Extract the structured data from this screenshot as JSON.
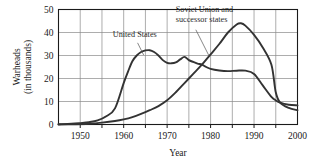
{
  "chart_data": {
    "type": "line",
    "title": "",
    "xlabel": "Year",
    "ylabel": "Warheads (in thousands)",
    "ylabel_line1": "Warheads",
    "ylabel_line2": "(in thousands)",
    "xlim": [
      1945,
      2000
    ],
    "ylim": [
      0,
      50
    ],
    "xticks": [
      1950,
      1960,
      1970,
      1980,
      1990,
      2000
    ],
    "xtick_labels": [
      "1950",
      "1960",
      "1970",
      "1980",
      "1990",
      "2000"
    ],
    "yticks": [
      0,
      10,
      20,
      30,
      40,
      50
    ],
    "ytick_labels": [
      "0",
      "10",
      "20",
      "30",
      "40",
      "50"
    ],
    "x_gridlines": [
      1950,
      1955,
      1960,
      1965,
      1970,
      1975,
      1980,
      1985,
      1990,
      1995
    ],
    "y_gridlines": [
      10,
      20,
      30,
      40
    ],
    "x_minor_ticks": [
      1950,
      1955,
      1960,
      1965,
      1970,
      1975,
      1980,
      1985,
      1990,
      1995
    ],
    "grid": true,
    "legend_position": "inline-annotations",
    "series": [
      {
        "name": "United States",
        "label": "United States",
        "color": "#333333",
        "x": [
          1945,
          1948,
          1950,
          1952,
          1954,
          1956,
          1958,
          1960,
          1961,
          1962,
          1963,
          1964,
          1965,
          1966,
          1967,
          1968,
          1969,
          1970,
          1971,
          1972,
          1973,
          1974,
          1975,
          1976,
          1977,
          1978,
          1979,
          1980,
          1982,
          1984,
          1986,
          1988,
          1990,
          1992,
          1994,
          1995,
          1996,
          1998,
          2000
        ],
        "values": [
          0.1,
          0.3,
          0.6,
          1.0,
          1.8,
          3.6,
          7.0,
          18.0,
          23.0,
          27.5,
          30.0,
          31.5,
          32.2,
          32.3,
          31.5,
          30.0,
          28.0,
          26.8,
          26.6,
          27.0,
          28.3,
          29.4,
          28.0,
          27.2,
          26.5,
          26.0,
          25.0,
          24.2,
          23.5,
          23.2,
          23.4,
          23.4,
          22.0,
          17.0,
          12.0,
          10.5,
          9.5,
          8.6,
          8.3
        ]
      },
      {
        "name": "Soviet Union and successor states",
        "label": "Soviet Union and successor states",
        "label_line1": "Soviet Union and",
        "label_line2": "successor states",
        "color": "#333333",
        "x": [
          1945,
          1949,
          1952,
          1955,
          1958,
          1960,
          1962,
          1964,
          1966,
          1968,
          1970,
          1972,
          1974,
          1976,
          1978,
          1980,
          1982,
          1984,
          1986,
          1987,
          1988,
          1990,
          1992,
          1994,
          1995,
          1996,
          1998,
          2000
        ],
        "values": [
          0.0,
          0.1,
          0.3,
          0.8,
          1.5,
          2.2,
          3.2,
          4.6,
          6.2,
          8.0,
          10.5,
          14.0,
          18.0,
          22.0,
          26.0,
          30.5,
          35.0,
          40.0,
          43.5,
          44.0,
          43.0,
          39.0,
          33.5,
          26.0,
          14.0,
          9.5,
          7.2,
          6.2
        ]
      }
    ],
    "annotations": [
      {
        "name": "us-annotation",
        "text": "United States",
        "label_x": 1957.5,
        "label_y": 38.0,
        "leader_from": [
          1963.2,
          35.5
        ],
        "leader_to": [
          1964.6,
          30.2
        ]
      },
      {
        "name": "ussr-annotation",
        "text": "Soviet Union and successor states",
        "label_x": 1972.0,
        "label_y": 49.0,
        "leader_from": [
          1976.6,
          41.2
        ],
        "leader_to": [
          1979.6,
          30.0
        ]
      }
    ]
  },
  "colors": {
    "background": "#ffffff",
    "axis": "#1a1a1a",
    "grid": "#8a8a8a",
    "curve": "#333333",
    "text": "#1a1a1a"
  }
}
